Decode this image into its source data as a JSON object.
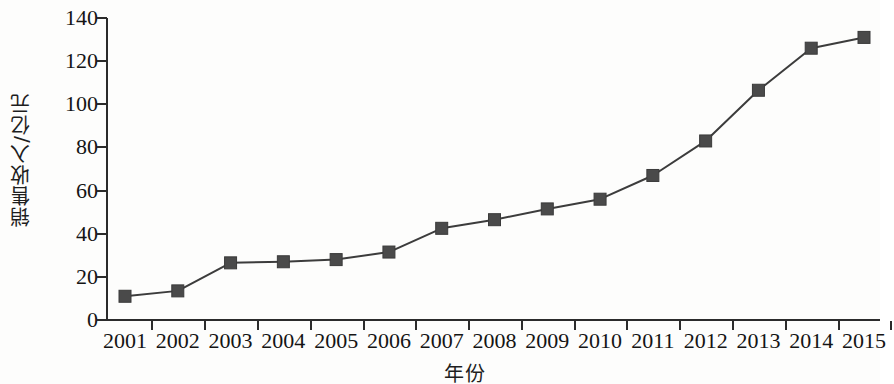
{
  "chart_data": {
    "type": "line",
    "title": "",
    "subtitle": "",
    "xlabel": "年份",
    "ylabel": "销售收入/亿元",
    "categories": [
      "2001",
      "2002",
      "2003",
      "2004",
      "2005",
      "2006",
      "2007",
      "2008",
      "2009",
      "2010",
      "2011",
      "2012",
      "2013",
      "2014",
      "2015"
    ],
    "x": [
      2001,
      2002,
      2003,
      2004,
      2005,
      2006,
      2007,
      2008,
      2009,
      2010,
      2011,
      2012,
      2013,
      2014,
      2015
    ],
    "values": [
      11,
      13.5,
      26.5,
      27,
      28,
      31.5,
      42.5,
      46.5,
      51.5,
      56,
      67,
      83,
      106.5,
      126,
      131
    ],
    "series": [
      {
        "name": "销售收入",
        "values": [
          11,
          13.5,
          26.5,
          27,
          28,
          31.5,
          42.5,
          46.5,
          51.5,
          56,
          67,
          83,
          106.5,
          126,
          131
        ]
      }
    ],
    "ylim": [
      0,
      140
    ],
    "yticks": [
      0,
      20,
      40,
      60,
      80,
      100,
      120,
      140
    ],
    "ytick_labels": [
      "0",
      "20",
      "40",
      "60",
      "80",
      "100",
      "120",
      "140"
    ],
    "xtick_labels": [
      "2001",
      "2002",
      "2003",
      "2004",
      "2005",
      "2006",
      "2007",
      "2008",
      "2009",
      "2010",
      "2011",
      "2012",
      "2013",
      "2014",
      "2015"
    ],
    "grid": false,
    "legend": false,
    "legend_position": "none",
    "marker": "square",
    "marker_color": "#4a4a4a",
    "line_color": "#3c3c3c",
    "axis_color": "#2b2b2b",
    "background_color": "#fdfdfc",
    "annotations": []
  }
}
